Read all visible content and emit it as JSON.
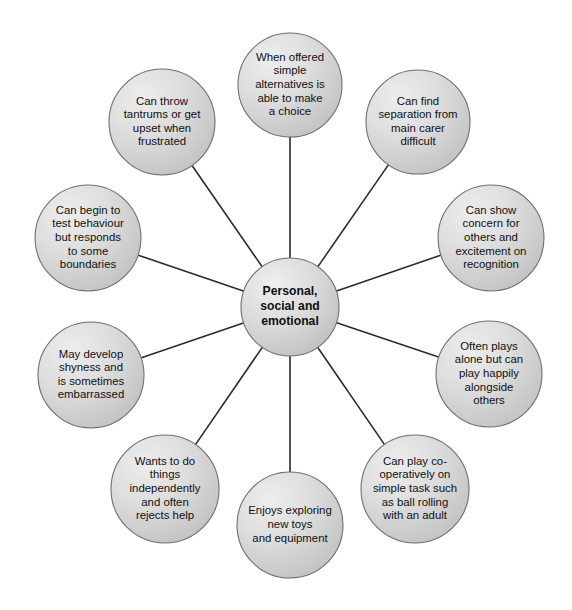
{
  "diagram": {
    "type": "radial-spoke-map",
    "title_node": {
      "id": "center",
      "lines": [
        "Personal,",
        "social and",
        "emotional"
      ],
      "text": "Personal, social and emotional",
      "cx": 290,
      "cy": 307,
      "r": 49
    },
    "style": {
      "background": "#ffffff",
      "node_fill_light": "#e4e4e4",
      "node_fill_dark": "#c3c3c3",
      "node_border": "#6f6f6f",
      "connector_color": "#2b2b2b",
      "text_color": "#101010"
    },
    "nodes": [
      {
        "id": "node-choice",
        "name": "offered-simple-alternatives",
        "text": "When offered simple alternatives is able to make a choice",
        "lines": [
          "When offered",
          "simple",
          "alternatives is",
          "able to make",
          "a choice"
        ],
        "cx": 290,
        "cy": 85,
        "r": 52
      },
      {
        "id": "node-separation",
        "name": "separation-from-carer",
        "text": "Can find separation from main carer difficult",
        "lines": [
          "Can find",
          "separation from",
          "main carer",
          "difficult"
        ],
        "cx": 418,
        "cy": 122,
        "r": 52
      },
      {
        "id": "node-concern",
        "name": "concern-and-excitement",
        "text": "Can show concern for others and excitement on recognition",
        "lines": [
          "Can show",
          "concern for",
          "others and",
          "excitement on",
          "recognition"
        ],
        "cx": 491,
        "cy": 238,
        "r": 53
      },
      {
        "id": "node-alone",
        "name": "plays-alone-alongside",
        "text": "Often plays alone but can play happily alongside others",
        "lines": [
          "Often plays",
          "alone but can",
          "play happily",
          "alongside",
          "others"
        ],
        "cx": 489,
        "cy": 374,
        "r": 53
      },
      {
        "id": "node-cooperative",
        "name": "co-operative-play",
        "text": "Can play co-operatively on simple task such as ball rolling with an adult",
        "lines": [
          "Can play co-",
          "operatively on",
          "simple task such",
          "as ball rolling",
          "with an adult"
        ],
        "cx": 415,
        "cy": 489,
        "r": 54
      },
      {
        "id": "node-exploring",
        "name": "enjoys-exploring-toys",
        "text": "Enjoys exploring new toys and equipment",
        "lines": [
          "Enjoys exploring",
          "new toys",
          "and equipment"
        ],
        "cx": 290,
        "cy": 525,
        "r": 53
      },
      {
        "id": "node-independent",
        "name": "wants-independence",
        "text": "Wants to do things independently and often rejects help",
        "lines": [
          "Wants to do",
          "things",
          "independently",
          "and often",
          "rejects help"
        ],
        "cx": 165,
        "cy": 489,
        "r": 54
      },
      {
        "id": "node-shyness",
        "name": "develops-shyness",
        "text": "May develop shyness and is sometimes embarrassed",
        "lines": [
          "May develop",
          "shyness and",
          "is sometimes",
          "embarrassed"
        ],
        "cx": 91,
        "cy": 375,
        "r": 53
      },
      {
        "id": "node-boundaries",
        "name": "tests-behaviour-boundaries",
        "text": "Can begin to test behaviour but responds to some boundaries",
        "lines": [
          "Can begin to",
          "test behaviour",
          "but responds",
          "to some",
          "boundaries"
        ],
        "cx": 88,
        "cy": 238,
        "r": 53
      },
      {
        "id": "node-tantrums",
        "name": "throws-tantrums",
        "text": "Can throw tantrums or get upset when frustrated",
        "lines": [
          "Can throw",
          "tantrums or get",
          "upset when",
          "frustrated"
        ],
        "cx": 162,
        "cy": 122,
        "r": 53
      }
    ]
  }
}
